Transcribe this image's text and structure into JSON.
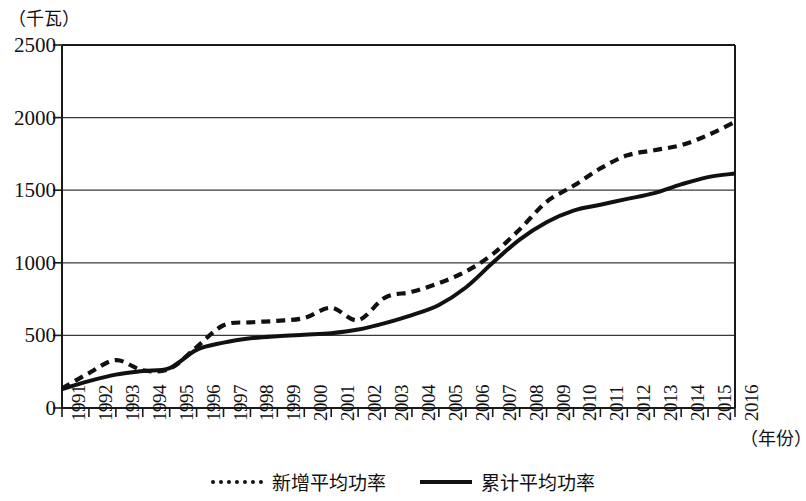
{
  "chart_data": {
    "type": "line",
    "title": "",
    "subtitle": "",
    "ylabel": "（千瓦）",
    "xlabel": "（年份）",
    "grid": true,
    "legend_position": "bottom-center",
    "ylim": [
      0,
      2500
    ],
    "yticks": [
      0,
      500,
      1000,
      1500,
      2000,
      2500
    ],
    "ytick_labels": [
      "0",
      "500",
      "1000",
      "1500",
      "2000",
      "2500"
    ],
    "categories": [
      "1991",
      "1992",
      "1993",
      "1994",
      "1995",
      "1996",
      "1997",
      "1998",
      "1999",
      "2000",
      "2001",
      "2002",
      "2003",
      "2004",
      "2005",
      "2006",
      "2007",
      "2008",
      "2009",
      "2010",
      "2011",
      "2012",
      "2013",
      "2014",
      "2015",
      "2016"
    ],
    "series": [
      {
        "name": "新增平均功率",
        "style": "dashed",
        "color": "#111111",
        "values": [
          135,
          240,
          330,
          260,
          270,
          420,
          570,
          590,
          600,
          620,
          690,
          605,
          760,
          800,
          860,
          940,
          1060,
          1230,
          1420,
          1530,
          1650,
          1740,
          1775,
          1810,
          1880,
          1970
        ]
      },
      {
        "name": "累计平均功率",
        "style": "solid",
        "color": "#111111",
        "values": [
          130,
          185,
          230,
          255,
          275,
          400,
          450,
          480,
          495,
          505,
          515,
          540,
          585,
          640,
          710,
          830,
          1000,
          1160,
          1280,
          1360,
          1400,
          1440,
          1480,
          1540,
          1590,
          1615
        ]
      }
    ],
    "legend": [
      "新增平均功率",
      "累计平均功率"
    ]
  }
}
